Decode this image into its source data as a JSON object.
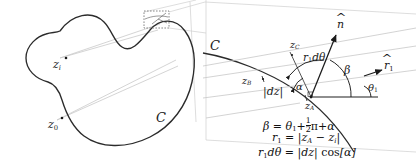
{
  "figure": {
    "background": "#ffffff",
    "ink": "#1a1a1a",
    "faint": "#bfbfbf"
  },
  "left_panel": {
    "name": "closed-contour-overview",
    "contour_label": "C",
    "points": [
      {
        "id": "z_i",
        "base": "z",
        "sub": "i",
        "x": 57,
        "y": 63
      },
      {
        "id": "z_0",
        "base": "z",
        "sub": "0",
        "x": 52,
        "y": 123
      }
    ],
    "detail_box": {
      "label": "magnifier-box",
      "x": 144,
      "y": 11,
      "width": 25,
      "height": 17
    }
  },
  "right_panel": {
    "name": "magnified-detail",
    "contour_label": "C",
    "labels": [
      {
        "id": "C",
        "base": "C",
        "sub": "",
        "x": 213,
        "y": 45
      },
      {
        "id": "z_B",
        "base": "z",
        "sub": "B",
        "x": 243,
        "y": 80
      },
      {
        "id": "z_C",
        "base": "z",
        "sub": "C",
        "x": 293,
        "y": 45
      },
      {
        "id": "z_A",
        "base": "z",
        "sub": "A",
        "x": 312,
        "y": 104
      },
      {
        "id": "dz",
        "base": "|dz|",
        "sub": "",
        "x": 268,
        "y": 90
      },
      {
        "id": "r1dth",
        "base": "r1dθ",
        "sub": "",
        "x": 307,
        "y": 58
      }
    ],
    "angles": [
      {
        "id": "alpha",
        "glyph": "α",
        "x": 297,
        "y": 86
      },
      {
        "id": "beta",
        "glyph": "β",
        "x": 342,
        "y": 73
      },
      {
        "id": "theta_1",
        "glyph": "θ",
        "sub": "1",
        "x": 369,
        "y": 88
      }
    ],
    "vectors": [
      {
        "id": "n_hat",
        "glyph": "n",
        "hat": true,
        "x": 339,
        "y": 22
      },
      {
        "id": "r1_hat",
        "glyph": "r",
        "sub": "1",
        "hat": true,
        "x": 385,
        "y": 66
      }
    ],
    "equations": [
      {
        "id": "eq-beta",
        "text": "β = θ₁ + ½π + α"
      },
      {
        "id": "eq-r1",
        "text": "r₁ = |z_A − z_i|"
      },
      {
        "id": "eq-r1dth",
        "text": "r₁ dθ = |dz| cos[α]"
      }
    ]
  }
}
